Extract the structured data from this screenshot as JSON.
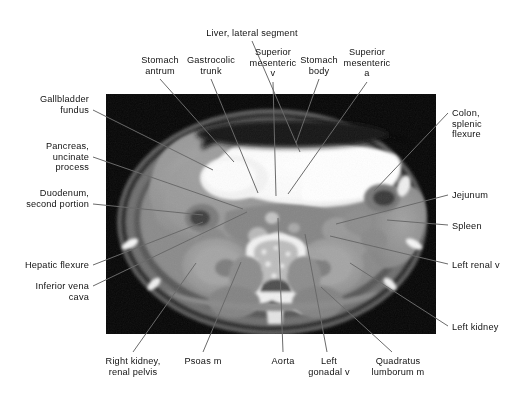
{
  "figure": {
    "type": "annotated-ct-scan",
    "modality": "CT",
    "plane": "axial",
    "region": "abdomen",
    "background_color": "#ffffff",
    "leader_line_color": "#6a6a6a",
    "text_color": "#111111",
    "image_frame": {
      "x": 106,
      "y": 94,
      "width": 330,
      "height": 240
    }
  },
  "labels": [
    {
      "id": "liver-lateral-segment",
      "text": "Liver, lateral segment",
      "align": "center",
      "x": 252,
      "y": 28,
      "anchor_x": 252,
      "anchor_y": 41,
      "target_x": 300,
      "target_y": 152
    },
    {
      "id": "stomach-antrum",
      "text": "Stomach\nantrum",
      "align": "center",
      "x": 160,
      "y": 55,
      "anchor_x": 160,
      "anchor_y": 79,
      "target_x": 234,
      "target_y": 162
    },
    {
      "id": "gastrocolic-trunk",
      "text": "Gastrocolic\ntrunk",
      "align": "center",
      "x": 211,
      "y": 55,
      "anchor_x": 211,
      "anchor_y": 79,
      "target_x": 258,
      "target_y": 193
    },
    {
      "id": "superior-mesenteric-v",
      "text": "Superior\nmesenteric\nv",
      "align": "center",
      "x": 273,
      "y": 47,
      "anchor_x": 273,
      "anchor_y": 82,
      "target_x": 276,
      "target_y": 196
    },
    {
      "id": "stomach-body",
      "text": "Stomach\nbody",
      "align": "center",
      "x": 319,
      "y": 55,
      "anchor_x": 319,
      "anchor_y": 79,
      "target_x": 296,
      "target_y": 143
    },
    {
      "id": "superior-mesenteric-a",
      "text": "Superior\nmesenteric\na",
      "align": "center",
      "x": 367,
      "y": 47,
      "anchor_x": 367,
      "anchor_y": 82,
      "target_x": 288,
      "target_y": 194
    },
    {
      "id": "gallbladder-fundus",
      "text": "Gallbladder\nfundus",
      "align": "right",
      "x": 89,
      "y": 94,
      "anchor_x": 93,
      "anchor_y": 110,
      "target_x": 213,
      "target_y": 170
    },
    {
      "id": "pancreas-uncinate-process",
      "text": "Pancreas,\nuncinate\nprocess",
      "align": "right",
      "x": 89,
      "y": 141,
      "anchor_x": 93,
      "anchor_y": 157,
      "target_x": 243,
      "target_y": 209
    },
    {
      "id": "duodenum-second-portion",
      "text": "Duodenum,\nsecond portion",
      "align": "right",
      "x": 89,
      "y": 188,
      "anchor_x": 93,
      "anchor_y": 204,
      "target_x": 203,
      "target_y": 215
    },
    {
      "id": "hepatic-flexure",
      "text": "Hepatic flexure",
      "align": "right",
      "x": 89,
      "y": 260,
      "anchor_x": 93,
      "anchor_y": 265,
      "target_x": 203,
      "target_y": 222
    },
    {
      "id": "inferior-vena-cava",
      "text": "Inferior vena\ncava",
      "align": "right",
      "x": 89,
      "y": 281,
      "anchor_x": 93,
      "anchor_y": 286,
      "target_x": 247,
      "target_y": 212
    },
    {
      "id": "colon-splenic-flexure",
      "text": "Colon,\nsplenic\nflexure",
      "align": "left",
      "x": 452,
      "y": 108,
      "anchor_x": 448,
      "anchor_y": 113,
      "target_x": 374,
      "target_y": 191
    },
    {
      "id": "jejunum",
      "text": "Jejunum",
      "align": "left",
      "x": 452,
      "y": 190,
      "anchor_x": 448,
      "anchor_y": 195,
      "target_x": 336,
      "target_y": 224
    },
    {
      "id": "spleen",
      "text": "Spleen",
      "align": "left",
      "x": 452,
      "y": 221,
      "anchor_x": 448,
      "anchor_y": 225,
      "target_x": 387,
      "target_y": 220
    },
    {
      "id": "left-renal-v",
      "text": "Left renal v",
      "align": "left",
      "x": 452,
      "y": 260,
      "anchor_x": 448,
      "anchor_y": 264,
      "target_x": 330,
      "target_y": 236
    },
    {
      "id": "left-kidney",
      "text": "Left kidney",
      "align": "left",
      "x": 452,
      "y": 322,
      "anchor_x": 448,
      "anchor_y": 326,
      "target_x": 350,
      "target_y": 263
    },
    {
      "id": "right-kidney-renal-pelvis",
      "text": "Right kidney,\nrenal pelvis",
      "align": "center",
      "x": 133,
      "y": 356,
      "anchor_x": 133,
      "anchor_y": 352,
      "target_x": 196,
      "target_y": 263
    },
    {
      "id": "psoas-m",
      "text": "Psoas m",
      "align": "center",
      "x": 203,
      "y": 356,
      "anchor_x": 203,
      "anchor_y": 352,
      "target_x": 241,
      "target_y": 262
    },
    {
      "id": "aorta",
      "text": "Aorta",
      "align": "center",
      "x": 283,
      "y": 356,
      "anchor_x": 283,
      "anchor_y": 352,
      "target_x": 278,
      "target_y": 218
    },
    {
      "id": "left-gonadal-v",
      "text": "Left\ngonadal v",
      "align": "center",
      "x": 329,
      "y": 356,
      "anchor_x": 327,
      "anchor_y": 352,
      "target_x": 305,
      "target_y": 234
    },
    {
      "id": "quadratus-lumborum-m",
      "text": "Quadratus\nlumborum m",
      "align": "center",
      "x": 398,
      "y": 356,
      "anchor_x": 392,
      "anchor_y": 352,
      "target_x": 321,
      "target_y": 287
    }
  ]
}
